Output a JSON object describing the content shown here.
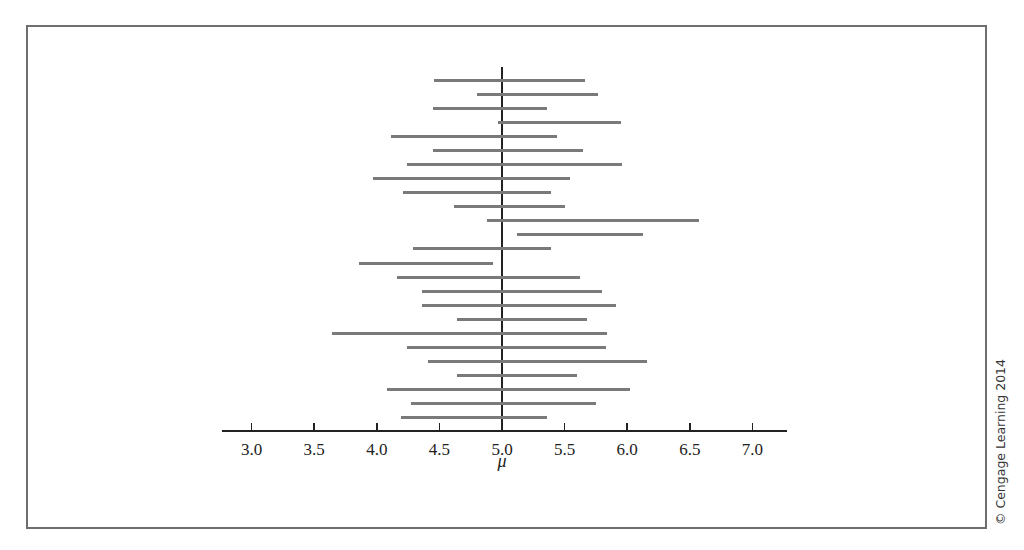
{
  "chart_data": {
    "type": "interval",
    "title": "",
    "xlabel": "μ",
    "ylabel": "",
    "xlim": [
      2.76,
      7.27
    ],
    "xticks": [
      3.0,
      3.5,
      4.0,
      4.5,
      5.0,
      5.5,
      6.0,
      6.5,
      7.0
    ],
    "xtick_labels": [
      "3.0",
      "3.5",
      "4.0",
      "4.5",
      "5.0",
      "5.5",
      "6.0",
      "6.5",
      "7.0"
    ],
    "reference_line": 5.0,
    "grid": false,
    "legend": null,
    "intervals": [
      {
        "lower": 4.46,
        "upper": 5.66
      },
      {
        "lower": 4.8,
        "upper": 5.77
      },
      {
        "lower": 4.45,
        "upper": 5.36
      },
      {
        "lower": 4.97,
        "upper": 5.95
      },
      {
        "lower": 4.11,
        "upper": 5.44
      },
      {
        "lower": 4.45,
        "upper": 5.65
      },
      {
        "lower": 4.24,
        "upper": 5.96
      },
      {
        "lower": 3.97,
        "upper": 5.54
      },
      {
        "lower": 4.21,
        "upper": 5.39
      },
      {
        "lower": 4.62,
        "upper": 5.5
      },
      {
        "lower": 4.88,
        "upper": 6.57
      },
      {
        "lower": 5.12,
        "upper": 6.13
      },
      {
        "lower": 4.29,
        "upper": 5.39
      },
      {
        "lower": 3.86,
        "upper": 4.93
      },
      {
        "lower": 4.16,
        "upper": 5.62
      },
      {
        "lower": 4.36,
        "upper": 5.8
      },
      {
        "lower": 4.36,
        "upper": 5.91
      },
      {
        "lower": 4.64,
        "upper": 5.68
      },
      {
        "lower": 3.64,
        "upper": 5.84
      },
      {
        "lower": 4.24,
        "upper": 5.83
      },
      {
        "lower": 4.41,
        "upper": 6.16
      },
      {
        "lower": 4.64,
        "upper": 5.6
      },
      {
        "lower": 4.08,
        "upper": 6.02
      },
      {
        "lower": 4.27,
        "upper": 5.75
      },
      {
        "lower": 4.19,
        "upper": 5.36
      }
    ]
  },
  "colors": {
    "interval_bar": "#7a7a7a",
    "axis": "#222222",
    "frame": "#6e6e6e"
  },
  "copyright": "© Cengage Learning 2014"
}
